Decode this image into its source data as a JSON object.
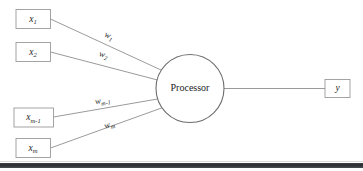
{
  "diagram": {
    "background_color": "#ffffff",
    "line_color": "#8f8f8f",
    "box_border_color": "#9a9a9a",
    "circle_border_color": "#6d6d6d",
    "text_color": "#1d1d1d",
    "bottom_band_color": "#2f3237"
  },
  "processor": {
    "label": "Processor"
  },
  "inputs": [
    {
      "base": "x",
      "sub": "1",
      "name": "input-x1"
    },
    {
      "base": "x",
      "sub": "2",
      "name": "input-x2"
    },
    {
      "base": "x",
      "sub": "m-1",
      "name": "input-xm-1"
    },
    {
      "base": "x",
      "sub": "m",
      "name": "input-xm"
    }
  ],
  "weights": [
    {
      "base": "w",
      "sub": "1",
      "name": "weight-w1"
    },
    {
      "base": "w",
      "sub": "2",
      "name": "weight-w2"
    },
    {
      "base": "w",
      "sub": "m-1",
      "name": "weight-wm-1"
    },
    {
      "base": "w",
      "sub": "m",
      "name": "weight-wm"
    }
  ],
  "output": {
    "base": "y",
    "sub": "",
    "name": "output-y"
  }
}
